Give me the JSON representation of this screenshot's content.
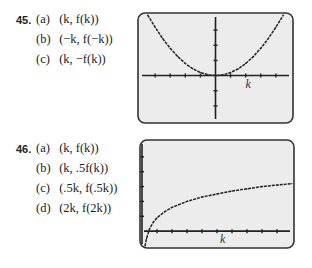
{
  "problems": [
    {
      "number": "45.",
      "parts": [
        {
          "label": "(a)",
          "expr": "(k, f(k))"
        },
        {
          "label": "(b)",
          "expr": "(−k, f(−k))"
        },
        {
          "label": "(c)",
          "expr": "(k, −f(k))"
        }
      ]
    },
    {
      "number": "46.",
      "parts": [
        {
          "label": "(a)",
          "expr": "(k, f(k))"
        },
        {
          "label": "(b)",
          "expr": "(k, .5f(k))"
        },
        {
          "label": "(c)",
          "expr": "(.5k, f(.5k))"
        },
        {
          "label": "(d)",
          "expr": "(2k, f(2k))"
        }
      ]
    }
  ],
  "chart_data": [
    {
      "type": "line",
      "title": "",
      "xlabel": "k",
      "ylabel": "",
      "description": "Calculator screen: parabola-like curve symmetric about the y-axis, touching x-axis near origin",
      "x": [
        -4.5,
        -4,
        -3.5,
        -3,
        -2.5,
        -2,
        -1.5,
        -1,
        -0.5,
        0,
        0.5,
        1,
        1.5,
        2,
        2.5,
        3,
        3.5,
        4,
        4.5
      ],
      "y": [
        4.05,
        3.2,
        2.45,
        1.8,
        1.25,
        0.8,
        0.45,
        0.2,
        0.05,
        0,
        0.05,
        0.2,
        0.45,
        0.8,
        1.25,
        1.8,
        2.45,
        3.2,
        4.05
      ],
      "xlim": [
        -5,
        5
      ],
      "ylim": [
        -3,
        4
      ],
      "grid": false,
      "axis_color": "#222222",
      "screen_color": "#ececec"
    },
    {
      "type": "line",
      "title": "",
      "xlabel": "k",
      "ylabel": "",
      "description": "Calculator screen: logarithm-like increasing curve starting just right of the y-axis",
      "x": [
        0.2,
        0.3,
        0.5,
        0.75,
        1,
        1.5,
        2,
        3,
        4,
        5,
        6,
        7,
        8,
        9,
        10
      ],
      "y": [
        -1,
        -0.5,
        0.15,
        0.6,
        0.9,
        1.3,
        1.6,
        2.0,
        2.3,
        2.5,
        2.7,
        2.85,
        3.0,
        3.1,
        3.2
      ],
      "xlim": [
        0,
        10
      ],
      "ylim": [
        -1,
        6
      ],
      "grid": false,
      "axis_color": "#222222",
      "screen_color": "#ececec"
    }
  ]
}
